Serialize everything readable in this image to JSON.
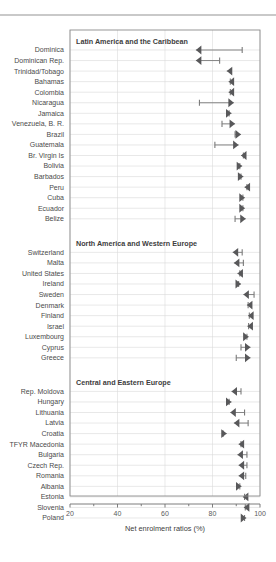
{
  "chart_data": {
    "type": "scatter",
    "title": "",
    "xlabel": "Net enrolment ratios (%)",
    "ylabel": "",
    "xlim": [
      20,
      100
    ],
    "xticks": [
      20,
      40,
      60,
      80,
      100
    ],
    "xtick_labels": [
      "20",
      "40",
      "60",
      "80",
      "100"
    ],
    "minor_xticks": [
      30,
      50,
      70,
      90
    ],
    "grid": true,
    "legend": "none",
    "panels": [
      {
        "title": "Latin America and the Caribbean",
        "rows": [
          {
            "label": "Dominica",
            "start": 92.5,
            "end": 73.0,
            "direction": "left"
          },
          {
            "label": "Dominican Rep.",
            "start": 83.0,
            "end": 73.0,
            "direction": "left"
          },
          {
            "label": "Trinidad/Tobago",
            "start": 88.0,
            "end": 86.0,
            "direction": "left"
          },
          {
            "label": "Bahamas",
            "start": 87.5,
            "end": 86.8,
            "direction": "left"
          },
          {
            "label": "Colombia",
            "start": 87.5,
            "end": 86.8,
            "direction": "left"
          },
          {
            "label": "Nicaragua",
            "start": 74.5,
            "end": 89.0,
            "direction": "right"
          },
          {
            "label": "Jamaica",
            "start": 87.0,
            "end": 88.0,
            "direction": "right"
          },
          {
            "label": "Venezuela, B. R.",
            "start": 84.0,
            "end": 89.5,
            "direction": "right"
          },
          {
            "label": "Brazil",
            "start": 89.5,
            "end": 92.0,
            "direction": "right"
          },
          {
            "label": "Guatemala",
            "start": 81.0,
            "end": 91.0,
            "direction": "right"
          },
          {
            "label": "Br. Virgin Is",
            "start": 93.0,
            "end": 92.0,
            "direction": "left"
          },
          {
            "label": "Bolivia",
            "start": 91.5,
            "end": 92.5,
            "direction": "right"
          },
          {
            "label": "Barbados",
            "start": 92.0,
            "end": 93.0,
            "direction": "right"
          },
          {
            "label": "Peru",
            "start": 94.5,
            "end": 93.5,
            "direction": "left"
          },
          {
            "label": "Cuba",
            "start": 92.8,
            "end": 93.6,
            "direction": "right"
          },
          {
            "label": "Ecuador",
            "start": 92.8,
            "end": 93.6,
            "direction": "right"
          },
          {
            "label": "Belize",
            "start": 89.5,
            "end": 94.0,
            "direction": "right"
          }
        ]
      },
      {
        "title": "North America and Western Europe",
        "rows": [
          {
            "label": "Switzerland",
            "start": 92.5,
            "end": 88.5,
            "direction": "left"
          },
          {
            "label": "Malta",
            "start": 93.0,
            "end": 89.0,
            "direction": "left"
          },
          {
            "label": "United States",
            "start": 91.5,
            "end": 90.5,
            "direction": "left"
          },
          {
            "label": "Ireland",
            "start": 91.0,
            "end": 92.0,
            "direction": "right"
          },
          {
            "label": "Sweden",
            "start": 97.5,
            "end": 93.0,
            "direction": "left"
          },
          {
            "label": "Denmark",
            "start": 95.0,
            "end": 94.5,
            "direction": "left"
          },
          {
            "label": "Finland",
            "start": 95.5,
            "end": 95.0,
            "direction": "left"
          },
          {
            "label": "Israel",
            "start": 95.2,
            "end": 94.7,
            "direction": "left"
          },
          {
            "label": "Luxembourg",
            "start": 94.5,
            "end": 95.2,
            "direction": "right"
          },
          {
            "label": "Cyprus",
            "start": 92.0,
            "end": 96.0,
            "direction": "right"
          },
          {
            "label": "Greece",
            "start": 90.0,
            "end": 96.0,
            "direction": "right"
          }
        ]
      },
      {
        "title": "Central and Eastern Europe",
        "rows": [
          {
            "label": "Rep. Moldova",
            "start": 92.0,
            "end": 88.0,
            "direction": "left"
          },
          {
            "label": "Hungary",
            "start": 87.0,
            "end": 88.0,
            "direction": "right"
          },
          {
            "label": "Lithuania",
            "start": 93.5,
            "end": 87.5,
            "direction": "left"
          },
          {
            "label": "Latvia",
            "start": 95.0,
            "end": 89.0,
            "direction": "left"
          },
          {
            "label": "Croatia",
            "start": 84.5,
            "end": 86.0,
            "direction": "right"
          },
          {
            "label": "TFYR Macedonia",
            "start": 92.0,
            "end": 91.0,
            "direction": "left"
          },
          {
            "label": "Bulgaria",
            "start": 94.5,
            "end": 90.5,
            "direction": "left"
          },
          {
            "label": "Czech Rep.",
            "start": 94.5,
            "end": 91.0,
            "direction": "left"
          },
          {
            "label": "Romania",
            "start": 94.0,
            "end": 91.0,
            "direction": "left"
          },
          {
            "label": "Albania",
            "start": 91.5,
            "end": 92.2,
            "direction": "right"
          },
          {
            "label": "Estonia",
            "start": 93.5,
            "end": 92.8,
            "direction": "left"
          },
          {
            "label": "Slovenia",
            "start": 93.8,
            "end": 93.2,
            "direction": "left"
          },
          {
            "label": "Poland",
            "start": 93.5,
            "end": 94.2,
            "direction": "right"
          }
        ]
      }
    ]
  }
}
